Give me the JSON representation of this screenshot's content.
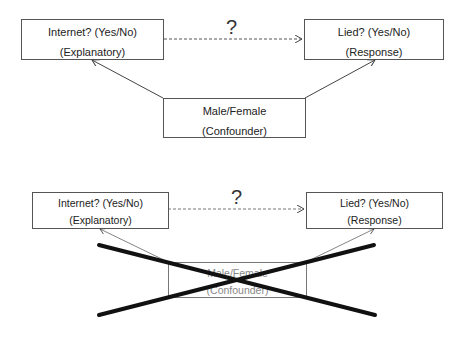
{
  "diagrams": [
    {
      "explanatory": {
        "line1": "Internet? (Yes/No)",
        "line2": "(Explanatory)"
      },
      "response": {
        "line1": "Lied?  (Yes/No)",
        "line2": "(Response)"
      },
      "confounder": {
        "line1": "Male/Female",
        "line2": "(Confounder)"
      },
      "question_mark": "?"
    },
    {
      "explanatory": {
        "line1": "Internet? (Yes/No)",
        "line2": "(Explanatory)"
      },
      "response": {
        "line1": "Lied?  (Yes/No)",
        "line2": "(Response)"
      },
      "confounder": {
        "line1": "Male/Female",
        "line2": "(Confounder)"
      },
      "question_mark": "?",
      "confounder_crossed_out": true
    }
  ]
}
